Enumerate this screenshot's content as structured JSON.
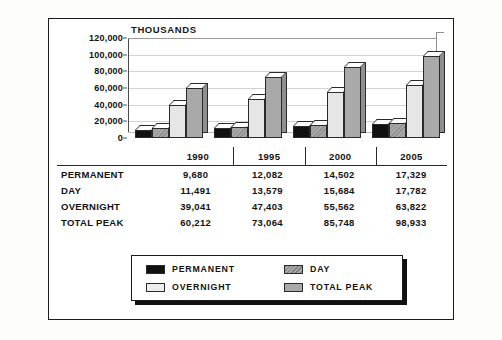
{
  "chart_data": {
    "type": "bar",
    "title": "",
    "unit_label": "THOUSANDS",
    "xlabel": "",
    "ylabel": "",
    "ylim": [
      0,
      120000
    ],
    "ytick_labels": [
      "120,000",
      "100,000",
      "80,000",
      "60,000",
      "40,000",
      "20,000",
      "0"
    ],
    "ytick_values": [
      120000,
      100000,
      80000,
      60000,
      40000,
      20000,
      0
    ],
    "grid": true,
    "grid_axis": "y",
    "legend_position": "bottom",
    "style": "3d-grouped-bar",
    "categories": [
      "1990",
      "1995",
      "2000",
      "2005"
    ],
    "series": [
      {
        "name": "PERMANENT",
        "color": "#111111",
        "pattern": "solid",
        "values": [
          9680,
          12082,
          14502,
          17329
        ]
      },
      {
        "name": "DAY",
        "color": "#a8a8a8",
        "pattern": "hatched",
        "values": [
          11491,
          13579,
          15684,
          17782
        ]
      },
      {
        "name": "OVERNIGHT",
        "color": "#e6e6e6",
        "pattern": "solid",
        "values": [
          39041,
          47403,
          55562,
          63822
        ]
      },
      {
        "name": "TOTAL PEAK",
        "color": "#a9a9a9",
        "pattern": "solid",
        "values": [
          60212,
          73064,
          85748,
          98933
        ]
      }
    ]
  },
  "table": {
    "year_headers": [
      "1990",
      "1995",
      "2000",
      "2005"
    ],
    "rows": [
      {
        "label": "PERMANENT",
        "values": [
          "9,680",
          "12,082",
          "14,502",
          "17,329"
        ]
      },
      {
        "label": "DAY",
        "values": [
          "11,491",
          "13,579",
          "15,684",
          "17,782"
        ]
      },
      {
        "label": "OVERNIGHT",
        "values": [
          "39,041",
          "47,403",
          "55,562",
          "63,822"
        ]
      },
      {
        "label": "TOTAL PEAK",
        "values": [
          "60,212",
          "73,064",
          "85,748",
          "98,933"
        ]
      }
    ]
  },
  "legend": {
    "items": [
      {
        "label": "PERMANENT",
        "swatch": "permanent"
      },
      {
        "label": "DAY",
        "swatch": "day"
      },
      {
        "label": "OVERNIGHT",
        "swatch": "overnight"
      },
      {
        "label": "TOTAL PEAK",
        "swatch": "total"
      }
    ]
  }
}
